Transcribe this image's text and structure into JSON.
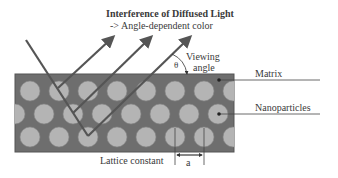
{
  "title": "Interference of Diffused Light",
  "subtitle": "-> Angle-dependent color",
  "labels": {
    "viewing_line1": "Viewing",
    "viewing_line2": "angle",
    "theta": "θ",
    "matrix": "Matrix",
    "nanoparticles": "Nanoparticles",
    "lattice_constant": "Lattice constant",
    "a": "a"
  },
  "colors": {
    "matrix": "#6e6e6e",
    "particle": "#b4b4b4",
    "ray": "#555555",
    "text": "#3a3a3a"
  }
}
